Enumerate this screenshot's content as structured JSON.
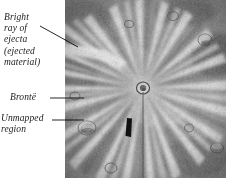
{
  "figure": {
    "kind": "annotated-photograph",
    "background_color": "#ffffff",
    "photo": {
      "name": "crater-photograph",
      "style": "grayscale aerial/orbital surface image",
      "left": 65,
      "top": 0,
      "width": 161,
      "height": 178
    }
  },
  "annotations": [
    {
      "id": "bright-ray",
      "text": "Bright\nray of\nejecta\n(ejected\nmaterial)",
      "leader": {
        "x1": 40,
        "y1": 26,
        "x2": 78,
        "y2": 47
      }
    },
    {
      "id": "bronte",
      "text": "Brontë",
      "leader": {
        "x1": 50,
        "y1": 98,
        "x2": 82,
        "y2": 98
      }
    },
    {
      "id": "unmapped-region",
      "text": "Unmapped\nregion",
      "leader": {
        "x1": 52,
        "y1": 120,
        "x2": 82,
        "y2": 120
      }
    }
  ],
  "markers": {
    "unmapped_patch": {
      "name": "unmapped-region-patch",
      "color": "#111111",
      "x": 126,
      "y": 118,
      "width": 7,
      "height": 19
    },
    "crater_center": {
      "x": 143,
      "y": 88
    },
    "meridian_line": {
      "x": 143,
      "color": "#4a4a4a"
    }
  },
  "colors": {
    "text": "#1a1a1a",
    "leader_line": "#000000",
    "photo_light": "#e8e8e8",
    "photo_mid": "#9a9a9a",
    "photo_dark": "#3c3c3c"
  }
}
